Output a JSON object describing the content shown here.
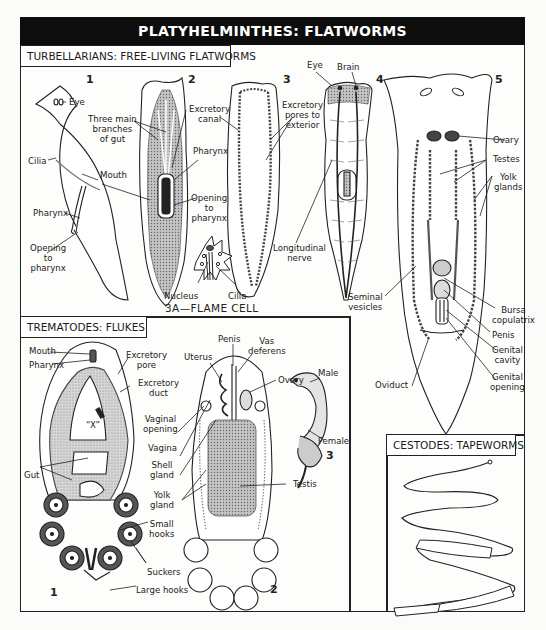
{
  "title": "PLATYHELMINTHES:  FLATWORMS",
  "sections": {
    "turbellarians": {
      "heading": "TURBELLARIANS: FREE-LIVING FLATWORMS",
      "figures": {
        "fig1": {
          "number": "1",
          "labels": {
            "eye": "Eye",
            "cilia": "Cilia",
            "mouth": "Mouth",
            "pharynx": "Pharynx",
            "opening_to_pharynx": "Opening\nto\npharynx"
          }
        },
        "fig2": {
          "number": "2",
          "labels": {
            "three_main_branches": "Three main\nbranches\nof gut",
            "pharynx": "Pharynx",
            "opening_to_pharynx": "Opening\nto\npharynx"
          }
        },
        "fig3": {
          "number": "3",
          "labels": {
            "excretory_canal": "Excretory\ncanal",
            "excretory_pores": "Excretory\npores to\nexterior"
          }
        },
        "fig3a": {
          "caption": "3A—FLAME  CELL",
          "labels": {
            "nucleus": "Nucleus",
            "cilia": "Cilia"
          }
        },
        "fig4": {
          "number": "4",
          "labels": {
            "eye": "Eye",
            "brain": "Brain",
            "longitudinal_nerve": "Longitudinal\nnerve"
          }
        },
        "fig5": {
          "number": "5",
          "labels": {
            "ovary": "Ovary",
            "testes": "Testes",
            "yolk_glands": "Yolk\nglands",
            "seminal_vesicles": "Seminal\nvesicles",
            "bursa_copulatrix": "Bursa\ncopulatrix",
            "penis": "Penis",
            "genital_cavity": "Genital\ncavity",
            "genital_opening": "Genital\nopening",
            "oviduct": "Oviduct"
          }
        }
      }
    },
    "trematodes": {
      "heading": "TREMATODES:  FLUKES",
      "figures": {
        "fig1": {
          "number": "1",
          "labels": {
            "mouth": "Mouth",
            "pharynx": "Pharynx",
            "excretory_pore": "Excretory\npore",
            "excretory_duct": "Excretory\nduct",
            "x_mark": "“X”",
            "gut": "Gut",
            "small_hooks": "Small\nhooks",
            "suckers": "Suckers",
            "large_hooks": "Large hooks"
          }
        },
        "fig2": {
          "number": "2",
          "labels": {
            "penis": "Penis",
            "vas_deferens": "Vas\ndeferens",
            "uterus": "Uterus",
            "ovary": "Ovary",
            "vaginal_opening": "Vaginal\nopening",
            "vagina": "Vagina",
            "shell_gland": "Shell\ngland",
            "yolk_gland": "Yolk\ngland",
            "testis": "Testis"
          }
        },
        "fig3": {
          "number": "3",
          "labels": {
            "male": "Male",
            "female": "Female"
          }
        }
      }
    },
    "cestodes": {
      "heading": "CESTODES:  TAPEWORMS"
    }
  },
  "colors": {
    "header_bg": "#0d0d0d",
    "header_text": "#ffffff",
    "ink": "#222222",
    "stipple": "#bdbdbd",
    "paper": "#fdfdfb"
  }
}
